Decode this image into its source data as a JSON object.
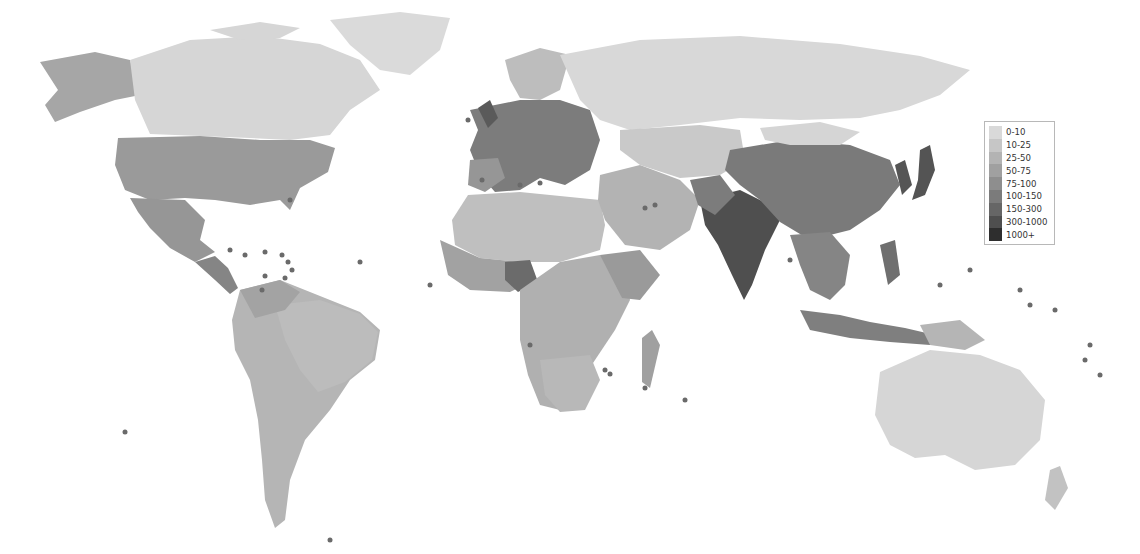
{
  "map": {
    "subject": "Population density by country (people per km²)",
    "style": "grayscale choropleth world map",
    "background": "#ffffff"
  },
  "legend": {
    "items": [
      {
        "label": "0-10",
        "color": "#d9d9d9"
      },
      {
        "label": "10-25",
        "color": "#c6c6c6"
      },
      {
        "label": "25-50",
        "color": "#b3b3b3"
      },
      {
        "label": "50-75",
        "color": "#a0a0a0"
      },
      {
        "label": "75-100",
        "color": "#8e8e8e"
      },
      {
        "label": "100-150",
        "color": "#7b7b7b"
      },
      {
        "label": "150-300",
        "color": "#666666"
      },
      {
        "label": "300-1000",
        "color": "#4f4f4f"
      },
      {
        "label": "1000+",
        "color": "#2e2e2e"
      }
    ]
  },
  "regions": [
    {
      "name": "Alaska",
      "class": "25-50"
    },
    {
      "name": "Canada",
      "class": "0-10"
    },
    {
      "name": "Greenland",
      "class": "0-10"
    },
    {
      "name": "United States",
      "class": "25-50"
    },
    {
      "name": "Mexico",
      "class": "50-75"
    },
    {
      "name": "Central America",
      "class": "75-100"
    },
    {
      "name": "South America",
      "class": "10-25"
    },
    {
      "name": "Europe",
      "class": "100-150"
    },
    {
      "name": "Russia",
      "class": "0-10"
    },
    {
      "name": "North Africa / Sahara",
      "class": "10-25"
    },
    {
      "name": "West Africa",
      "class": "50-75"
    },
    {
      "name": "Nigeria",
      "class": "150-300"
    },
    {
      "name": "Central / Southern Africa",
      "class": "25-50"
    },
    {
      "name": "Middle East",
      "class": "25-50"
    },
    {
      "name": "Central Asia",
      "class": "10-25"
    },
    {
      "name": "India",
      "class": "300-1000"
    },
    {
      "name": "China",
      "class": "100-150"
    },
    {
      "name": "Mongolia",
      "class": "0-10"
    },
    {
      "name": "Japan",
      "class": "300-1000"
    },
    {
      "name": "Southeast Asia",
      "class": "100-150"
    },
    {
      "name": "Indonesia / Philippines",
      "class": "100-150"
    },
    {
      "name": "Australia",
      "class": "0-10"
    },
    {
      "name": "New Zealand",
      "class": "10-25"
    },
    {
      "name": "Madagascar",
      "class": "25-50"
    }
  ]
}
